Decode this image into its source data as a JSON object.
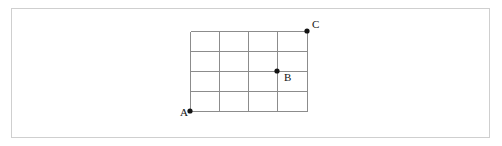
{
  "figure": {
    "width": 502,
    "height": 146,
    "background_color": "#ffffff",
    "frame": {
      "x": 11,
      "y": 8,
      "width": 479,
      "height": 130,
      "border_color": "#cfcfcf"
    },
    "ghost_text": "        \n       \n      "
  },
  "diagram": {
    "type": "rectangular-lattice-grid",
    "columns": 4,
    "rows": 4,
    "line_color": "#8c8c8c",
    "bounds": {
      "left": 190,
      "top": 31,
      "right": 307,
      "bottom": 111
    },
    "vertical_line_x": [
      190,
      219,
      248,
      277,
      307
    ],
    "horizontal_line_y": [
      31,
      51,
      71,
      91,
      111
    ],
    "points": [
      {
        "id": "A",
        "label": "A",
        "x": 190,
        "y": 111,
        "label_x": 180,
        "label_y": 116,
        "label_anchor": "left-of-point",
        "dot_color": "#141414",
        "dot_radius": 2.6,
        "grid_coordinate": [
          0,
          0
        ]
      },
      {
        "id": "B",
        "label": "B",
        "x": 277,
        "y": 71,
        "label_x": 284,
        "label_y": 81,
        "label_anchor": "lower-right-of-point",
        "dot_color": "#141414",
        "dot_radius": 2.6,
        "grid_coordinate": [
          3,
          2
        ]
      },
      {
        "id": "C",
        "label": "C",
        "x": 307,
        "y": 31,
        "label_x": 312,
        "label_y": 28,
        "label_anchor": "upper-right-of-point",
        "dot_color": "#141414",
        "dot_radius": 2.6,
        "grid_coordinate": [
          4,
          4
        ]
      }
    ]
  }
}
